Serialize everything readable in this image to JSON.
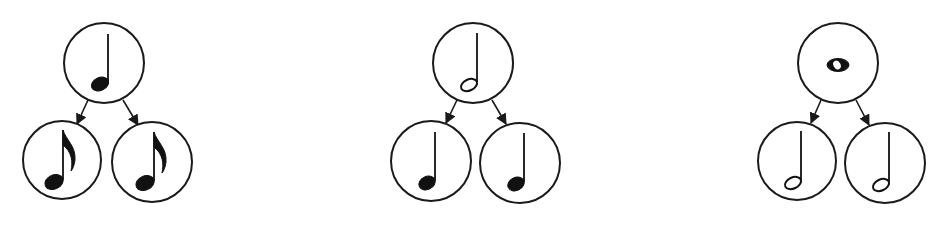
{
  "diagram": {
    "colors": {
      "stroke": "#1a1a1a",
      "ink": "#111111",
      "background": "#ffffff"
    },
    "trees": [
      {
        "id": "quarter-tree",
        "parent": {
          "note": "quarter-note",
          "label": "Quarter note"
        },
        "children": [
          {
            "note": "eighth-note",
            "label": "Eighth note"
          },
          {
            "note": "eighth-note",
            "label": "Eighth note"
          }
        ]
      },
      {
        "id": "half-tree",
        "parent": {
          "note": "half-note",
          "label": "Half note"
        },
        "children": [
          {
            "note": "quarter-note",
            "label": "Quarter note"
          },
          {
            "note": "quarter-note",
            "label": "Quarter note"
          }
        ]
      },
      {
        "id": "whole-tree",
        "parent": {
          "note": "whole-note",
          "label": "Whole note"
        },
        "children": [
          {
            "note": "half-note",
            "label": "Half note"
          },
          {
            "note": "half-note",
            "label": "Half note"
          }
        ]
      }
    ]
  }
}
